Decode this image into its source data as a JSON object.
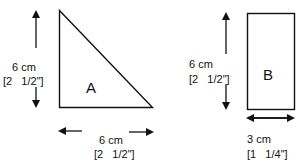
{
  "shapes": {
    "triangle": {
      "label": "A",
      "height_cm": "6 cm",
      "height_in": "[2   1/2\"]",
      "width_cm": "6 cm",
      "width_in": "[2   1/2\"]"
    },
    "rectangle": {
      "label": "B",
      "height_cm": "6 cm",
      "height_in": "[2   1/2\"]",
      "width_cm": "3 cm",
      "width_in": "[1   1/4\"]"
    }
  }
}
